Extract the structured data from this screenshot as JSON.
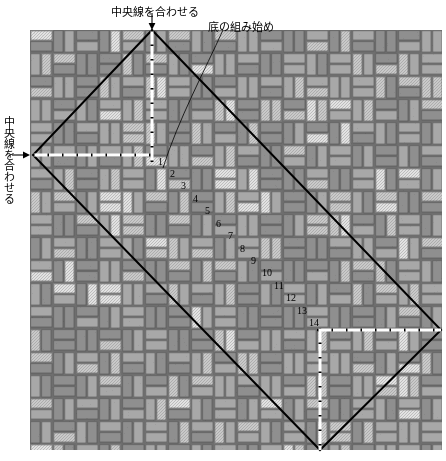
{
  "diagram": {
    "title_hidden": "",
    "type": "weaving-layout-diagram",
    "labels": {
      "center_line_top": "中央線を合わせる",
      "bottom_weave_start": "底の組み始め",
      "center_line_left": "中央線を合わせる"
    },
    "step_numbers": [
      "1",
      "2",
      "3",
      "4",
      "5",
      "6",
      "7",
      "8",
      "9",
      "10",
      "11",
      "12",
      "13",
      "14"
    ],
    "step_positions": [
      {
        "n": "1",
        "x": 158,
        "y": 157
      },
      {
        "n": "2",
        "x": 170,
        "y": 169
      },
      {
        "n": "3",
        "x": 181,
        "y": 181
      },
      {
        "n": "4",
        "x": 193,
        "y": 194
      },
      {
        "n": "5",
        "x": 205,
        "y": 206
      },
      {
        "n": "6",
        "x": 216,
        "y": 219
      },
      {
        "n": "7",
        "x": 228,
        "y": 231
      },
      {
        "n": "8",
        "x": 240,
        "y": 244
      },
      {
        "n": "9",
        "x": 251,
        "y": 256
      },
      {
        "n": "10",
        "x": 262,
        "y": 268
      },
      {
        "n": "11",
        "x": 274,
        "y": 281
      },
      {
        "n": "12",
        "x": 286,
        "y": 293
      },
      {
        "n": "13",
        "x": 297,
        "y": 306
      },
      {
        "n": "14",
        "x": 309,
        "y": 318
      }
    ],
    "diamond": {
      "top": [
        152,
        30
      ],
      "left": [
        33,
        155
      ],
      "bottom": [
        320,
        450
      ],
      "right": [
        441,
        330
      ],
      "stroke": "#000000",
      "stroke_width": 2
    },
    "dash_lines": [
      {
        "name": "vertical-center-top",
        "from": [
          152,
          30
        ],
        "to": [
          152,
          160
        ]
      },
      {
        "name": "horizontal-center-left",
        "from": [
          33,
          155
        ],
        "to": [
          152,
          155
        ]
      },
      {
        "name": "vertical-center-bottom",
        "from": [
          320,
          330
        ],
        "to": [
          320,
          450
        ]
      },
      {
        "name": "horizontal-center-right",
        "from": [
          317,
          330
        ],
        "to": [
          441,
          330
        ]
      }
    ],
    "arrows": [
      {
        "name": "arrow-down-top",
        "x": 152,
        "y": 18
      },
      {
        "name": "arrow-right-left",
        "x": 22,
        "y": 155
      }
    ],
    "leader_line": {
      "from": [
        223,
        30
      ],
      "to": [
        163,
        168
      ]
    },
    "colors": {
      "brick_dark": "#8f8f8f",
      "brick_mid": "#a8a8a8",
      "brick_light": "#c9c9c9",
      "brick_pale": "#e2e2e2",
      "mortar": "#6e6e6e",
      "background": "#ffffff",
      "ink": "#000000"
    },
    "pattern": {
      "name": "basket-weave",
      "cell_px": 23,
      "brick_long_px": 22,
      "brick_short_px": 10,
      "area": {
        "x": 30,
        "y": 30,
        "w": 412,
        "h": 420
      }
    }
  }
}
